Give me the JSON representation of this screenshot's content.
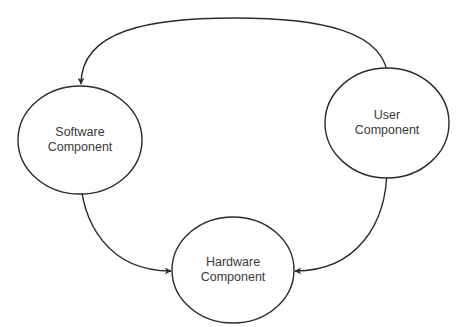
{
  "diagram": {
    "type": "bidirectional-relationship-diagram",
    "stroke_color": "#2a2a2a",
    "text_color": "#3a3a3a",
    "nodes": [
      {
        "id": "software",
        "shape": "ellipse",
        "label_line1": "Software",
        "label_line2": "Component"
      },
      {
        "id": "user",
        "shape": "ellipse",
        "label_line1": "User",
        "label_line2": "Component"
      },
      {
        "id": "hardware",
        "shape": "ellipse",
        "label_line1": "Hardware",
        "label_line2": "Component"
      }
    ],
    "edges": [
      {
        "from": "software",
        "to": "user",
        "direction": "both"
      },
      {
        "from": "software",
        "to": "hardware",
        "direction": "both"
      },
      {
        "from": "user",
        "to": "hardware",
        "direction": "both"
      }
    ]
  }
}
